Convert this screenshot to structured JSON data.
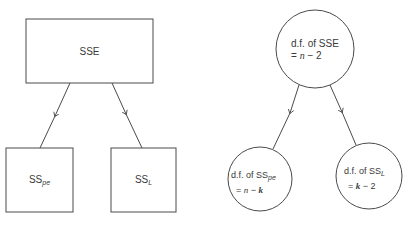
{
  "left_diagram": {
    "top_box": {
      "label": "SSE"
    },
    "bottom_left_box": {
      "label_main": "SS",
      "label_sub": "pe"
    },
    "bottom_right_box": {
      "label_main": "SS",
      "label_sub": "L"
    }
  },
  "right_diagram": {
    "top_circle": {
      "line1": "d.f. of SSE",
      "line2_prefix": "= ",
      "line2_var": "n",
      "line2_op": " − ",
      "line2_num": "2"
    },
    "bottom_left_circle": {
      "line1_prefix": "d.f. of SS",
      "line1_sub": "pe",
      "line2_prefix": "= ",
      "line2_var1": "n",
      "line2_op": " − ",
      "line2_var2": "k"
    },
    "bottom_right_circle": {
      "line1_prefix": "d.f. of SS",
      "line1_sub": "L",
      "line2_prefix": "= ",
      "line2_var": "k",
      "line2_op": " − ",
      "line2_num": "2"
    }
  },
  "colors": {
    "stroke": "#4a4a4a",
    "text": "#3a3a3a",
    "background": "#ffffff"
  }
}
